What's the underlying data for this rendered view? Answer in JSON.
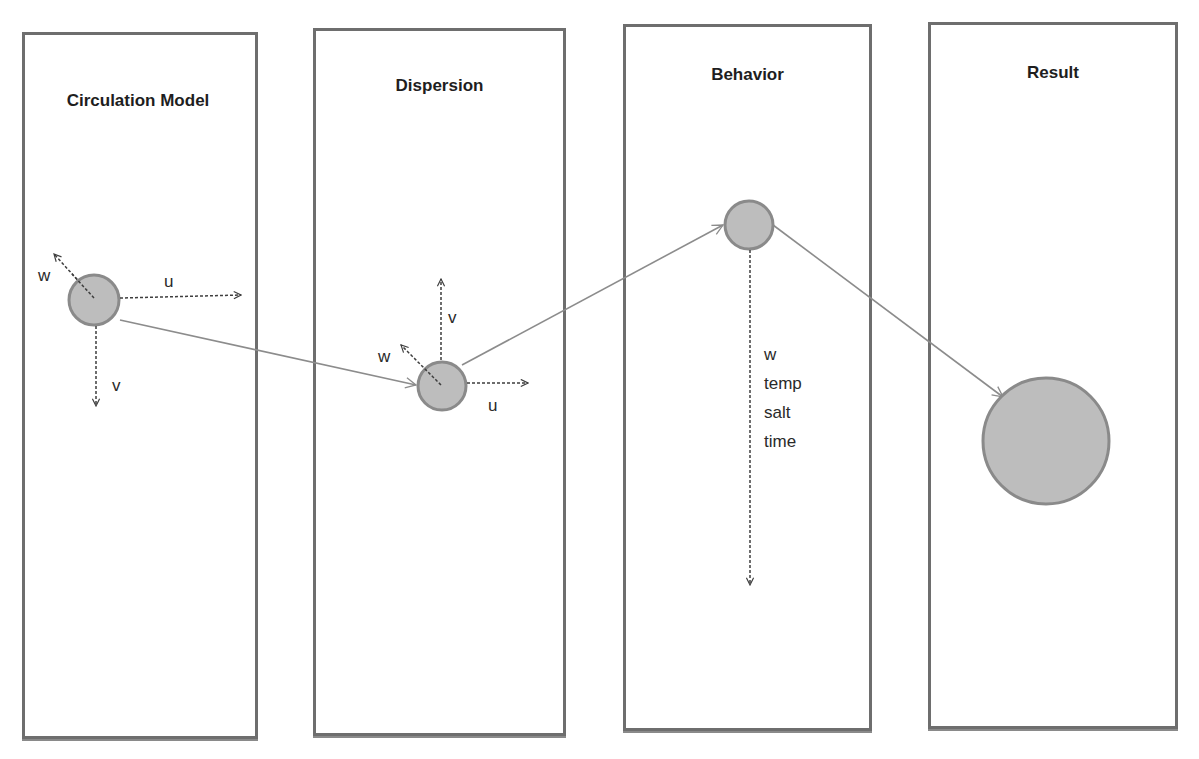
{
  "diagram": {
    "type": "process-flow",
    "panels": [
      {
        "id": "circulation",
        "title": "Circulation Model"
      },
      {
        "id": "dispersion",
        "title": "Dispersion"
      },
      {
        "id": "behavior",
        "title": "Behavior"
      },
      {
        "id": "result",
        "title": "Result"
      }
    ],
    "circulation": {
      "labels": {
        "w": "w",
        "u": "u",
        "v": "v"
      }
    },
    "dispersion": {
      "labels": {
        "w": "w",
        "u": "u",
        "v": "v"
      }
    },
    "behavior": {
      "variables": [
        "w",
        "temp",
        "salt",
        "time"
      ]
    },
    "flow": [
      "Circulation Model",
      "Dispersion",
      "Behavior",
      "Result"
    ],
    "colors": {
      "border": "#6e6e6e",
      "particle_fill": "#bdbdbd",
      "particle_stroke": "#8a8a8a",
      "connector": "#8c8c8c",
      "vector": "#4a4a4a"
    }
  }
}
